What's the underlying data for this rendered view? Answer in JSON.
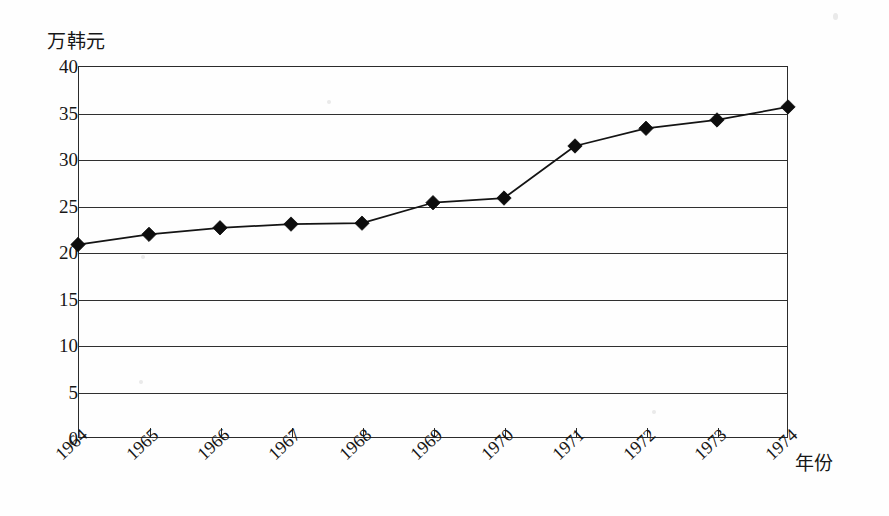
{
  "chart_data": {
    "type": "line",
    "title": "",
    "xlabel": "年份",
    "ylabel": "万韩元",
    "categories": [
      "1964",
      "1965",
      "1966",
      "1967",
      "1968",
      "1969",
      "1970",
      "1971",
      "1972",
      "1973",
      "1974"
    ],
    "values": [
      20.8,
      21.9,
      22.6,
      23.0,
      23.1,
      25.3,
      25.8,
      31.4,
      33.3,
      34.2,
      35.6
    ],
    "series": [
      {
        "name": "",
        "values": [
          20.8,
          21.9,
          22.6,
          23.0,
          23.1,
          25.3,
          25.8,
          31.4,
          33.3,
          34.2,
          35.6
        ]
      }
    ],
    "ylim": [
      0,
      40
    ],
    "ytick_step": 5,
    "yticks": [
      0,
      5,
      10,
      15,
      20,
      25,
      30,
      35,
      40
    ],
    "ytick_labels": [
      "0",
      "5",
      "10",
      "15",
      "20",
      "25",
      "30",
      "35",
      "40"
    ],
    "grid": "horizontal",
    "legend": "none",
    "marker": "diamond",
    "marker_color": "#0d0d0d",
    "line_color": "#141414",
    "frame": true,
    "xtick_label_rotation": -43
  },
  "axis": {
    "y_unit": "万韩元",
    "x_title": "年份"
  },
  "colors": {
    "background": "#fefefe",
    "axis": "#2b2b2b",
    "grid": "#303030",
    "text": "#171717",
    "series": "#141414"
  }
}
